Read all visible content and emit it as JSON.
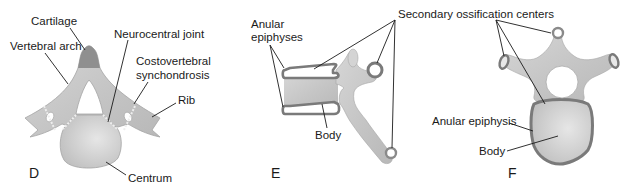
{
  "figure": {
    "panels": [
      {
        "id": "D",
        "letter": "D",
        "labels": {
          "cartilage": "Cartilage",
          "vertebral_arch": "Vertebral arch",
          "neurocentral_joint": "Neurocentral joint",
          "costovertebral_1": "Costovertebral",
          "costovertebral_2": "synchondrosis",
          "rib": "Rib",
          "centrum": "Centrum"
        }
      },
      {
        "id": "E",
        "letter": "E",
        "labels": {
          "anular_1": "Anular",
          "anular_2": "epiphyses",
          "body": "Body"
        }
      },
      {
        "id": "F",
        "letter": "F",
        "labels": {
          "anular_epiphysis": "Anular epiphysis",
          "body": "Body"
        }
      }
    ],
    "shared_labels": {
      "secondary_ossification": "Secondary ossification centers"
    },
    "colors": {
      "bone_light": "#cfcfcf",
      "bone_mid": "#bdbdbd",
      "cartilage_dark": "#8f8f8f",
      "epiphysis_ring": "#7a7a7a",
      "outline": "#9a9a9a",
      "text": "#1a1a1a"
    }
  }
}
